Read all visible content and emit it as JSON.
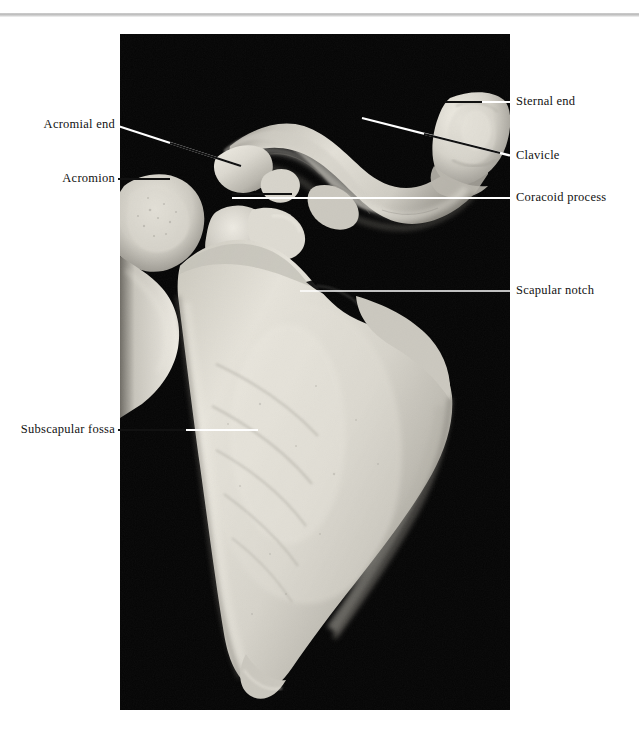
{
  "page": {
    "background_color": "#ffffff",
    "rule_color": "#c4c4c4",
    "running_head": "",
    "label_color": "#111111",
    "leader_color_on_black": "#ffffff",
    "leader_color_on_bone": "#000000"
  },
  "figure": {
    "caption": "",
    "panel": {
      "background_color": "#050505",
      "x": 120,
      "y": 34,
      "width": 390,
      "height": 676
    },
    "specimen": "Right scapula and clavicle, anterior (costal) view",
    "bone_color": "#d8d5cd"
  },
  "labels": [
    {
      "id": "sternal-end",
      "text": "Sternal end",
      "side": "right",
      "x": 516,
      "y": 95,
      "leader": {
        "x1": 445,
        "y1": 102,
        "x2": 512,
        "y2": 102,
        "stroke": "#ffffff"
      }
    },
    {
      "id": "clavicle",
      "text": "Clavicle",
      "side": "right",
      "x": 516,
      "y": 149,
      "leader": {
        "x1": 362,
        "y1": 118,
        "x2": 512,
        "y2": 156,
        "stroke": "#ffffff"
      }
    },
    {
      "id": "coracoid-process",
      "text": "Coracoid process",
      "side": "right",
      "x": 516,
      "y": 191,
      "leader": {
        "x1": 232,
        "y1": 198,
        "x2": 512,
        "y2": 198,
        "stroke": "#ffffff"
      }
    },
    {
      "id": "scapular-notch",
      "text": "Scapular notch",
      "side": "right",
      "x": 516,
      "y": 284,
      "leader": {
        "x1": 300,
        "y1": 291,
        "x2": 512,
        "y2": 291,
        "stroke": "#ffffff"
      }
    },
    {
      "id": "acromial-end",
      "text": "Acromial end",
      "side": "left",
      "x": 115,
      "y": 118,
      "leader": {
        "x1": 118,
        "y1": 126,
        "x2": 241,
        "y2": 166,
        "stroke": "#ffffff"
      }
    },
    {
      "id": "acromion",
      "text": "Acromion",
      "side": "left",
      "x": 115,
      "y": 172,
      "leader": {
        "x1": 118,
        "y1": 179,
        "x2": 170,
        "y2": 179,
        "stroke": "#ffffff"
      }
    },
    {
      "id": "subscapular-fossa",
      "text": "Subscapular fossa",
      "side": "left",
      "x": 115,
      "y": 423,
      "leader": {
        "x1": 118,
        "y1": 430,
        "x2": 258,
        "y2": 430,
        "stroke": "#ffffff"
      }
    }
  ]
}
